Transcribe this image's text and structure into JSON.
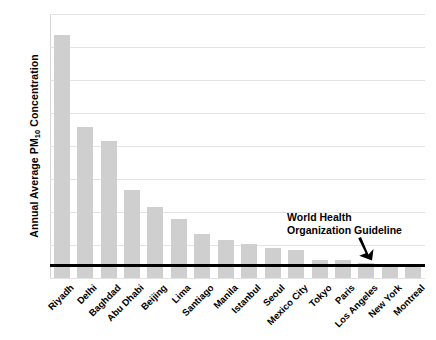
{
  "chart_data": {
    "type": "bar",
    "title": "",
    "subtitle": "",
    "xlabel": "",
    "ylabel_prefix": "Annual Average PM",
    "ylabel_sub": "10",
    "ylabel_suffix": " Concentration",
    "ylim": [
      0,
      400
    ],
    "yticks": [
      400,
      350,
      300,
      250,
      200,
      150,
      100,
      50,
      0
    ],
    "grid": true,
    "legend": null,
    "bar_color": "#cfcfcf",
    "categories": [
      "Riyadh",
      "Delhi",
      "Baghdad",
      "Abu Dhabi",
      "Beijing",
      "Lima",
      "Santiago",
      "Manila",
      "Istanbul",
      "Seoul",
      "Mexico City",
      "Tokyo",
      "Paris",
      "Los Angeles",
      "New York",
      "Montreal"
    ],
    "values": [
      368,
      229,
      208,
      134,
      108,
      90,
      66,
      57,
      52,
      46,
      43,
      28,
      27,
      22,
      21,
      19
    ],
    "annotations": [
      {
        "name": "who-guideline",
        "line1": "World Health",
        "line2": "Organization Guideline",
        "value": 20,
        "line_color": "#000000"
      }
    ]
  }
}
